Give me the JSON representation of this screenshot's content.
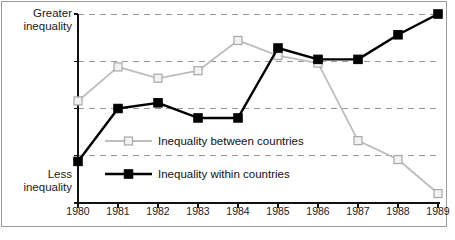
{
  "figure": {
    "background": "#ffffff",
    "border_color": "#9a9a9a",
    "caption": ""
  },
  "axis": {
    "y_top_label": "Greater\ninequality",
    "y_bottom_label": "Less\ninequality"
  },
  "legend": {
    "between_label": "Inequality between countries",
    "within_label": "Inequality within countries",
    "between_color": "#bdbdbd",
    "within_color": "#000000"
  },
  "chart_data": {
    "type": "line",
    "title": "",
    "xlabel": "",
    "ylabel": "",
    "grid": true,
    "gridlines": 5,
    "legend_position": "inside-center",
    "categories": [
      "1980",
      "1981",
      "1982",
      "1983",
      "1984",
      "1985",
      "1986",
      "1987",
      "1988",
      "1989"
    ],
    "ylim": [
      0,
      100
    ],
    "ytick_labels": [
      "Less inequality",
      "Greater inequality"
    ],
    "series": [
      {
        "name": "Inequality between countries",
        "color": "#bdbdbd",
        "marker": "open-square",
        "values": [
          54,
          72,
          66,
          70,
          86,
          78,
          74,
          33,
          23,
          5
        ]
      },
      {
        "name": "Inequality within countries",
        "color": "#000000",
        "marker": "filled-square",
        "values": [
          22,
          50,
          53,
          45,
          45,
          82,
          76,
          76,
          89,
          100
        ]
      }
    ]
  }
}
